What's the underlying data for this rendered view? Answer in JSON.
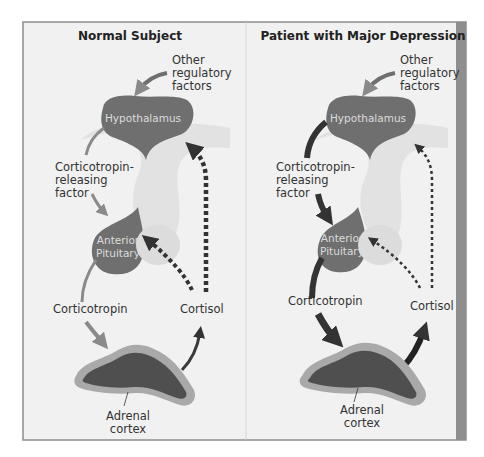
{
  "panels": [
    {
      "title": "Normal Subject",
      "labels": {
        "other_factors": [
          "Other",
          "regulatory",
          "factors"
        ],
        "crf": [
          "Corticotropin-",
          "releasing",
          "factor"
        ],
        "corticotropin": "Corticotropin",
        "cortisol": "Cortisol",
        "adrenal": [
          "Adrenal",
          "cortex"
        ]
      },
      "organs": {
        "hypothalamus": "Hypothalamus",
        "pituitary": [
          "Anterior",
          "Pituitary"
        ]
      },
      "arrow_style": "thin",
      "feedback_style": "thick-dashed"
    },
    {
      "title": "Patient with Major Depression",
      "labels": {
        "other_factors": [
          "Other",
          "regulatory",
          "factors"
        ],
        "crf": [
          "Corticotropin-",
          "releasing",
          "factor"
        ],
        "corticotropin": "Corticotropin",
        "cortisol": "Cortisol",
        "adrenal": [
          "Adrenal",
          "cortex"
        ]
      },
      "organs": {
        "hypothalamus": "Hypothalamus",
        "pituitary": [
          "Anterior",
          "Pituitary"
        ]
      },
      "arrow_style": "thick",
      "feedback_style": "thin-dashed"
    }
  ],
  "colors": {
    "panel_bg": "#f1f1f1",
    "organ": "#6f6f6f",
    "arrow_normal": "#8a8a8a",
    "arrow_dark": "#3a3a3a",
    "right_strip": "#8e8e8e"
  }
}
